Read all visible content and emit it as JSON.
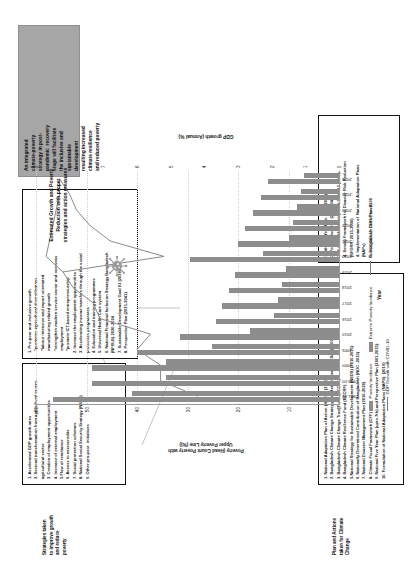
{
  "figure": {
    "annotation_caption": "Estimated  Growth and Poverty\nReduction with proper\nstrategies and action measures",
    "grey_callout": "An integrated\nclimate-poverty\nstrategy in post-\npandemic  recovery\nstage will facilitate\nthe inclusive and\nsustainable\ndevelopment\nresulting increased\nclimate resilience\nand reduced poverty",
    "left_label_growth": "Strategies taken\nto improve growth\nand reduce\npoverty",
    "left_label_climate": "Plan and Actions\ntaken for Climate\nChange",
    "virus_icon": "coronavirus-icon"
  },
  "chart_data": {
    "type": "bar",
    "title": "",
    "xlabel": "Year",
    "ylabel": "Poverty (Head Count Poverty with\nUpper Poverty Line (%))",
    "y2label": "GDP growth (Annual %)",
    "ylim": [
      0,
      60
    ],
    "yticks": [
      0,
      10,
      20,
      30,
      40,
      50,
      60
    ],
    "y2lim": [
      0,
      9
    ],
    "y2ticks": [
      0,
      1,
      2,
      3,
      4,
      5,
      6,
      7,
      8,
      9
    ],
    "grid": true,
    "legend_position": "bottom",
    "categories": [
      "1991-92",
      "1999-00",
      "2000",
      "2005",
      "2010",
      "2016",
      "2017",
      "2018",
      "2019",
      "2020",
      "2021",
      "2022",
      "2023",
      "2024",
      "2025"
    ],
    "series": [
      {
        "name": "Poverty Incidence",
        "type": "bar",
        "axis": "left",
        "color": "#8d8d8d",
        "values": [
          56.7,
          48.9,
          48.9,
          40.0,
          31.5,
          24.3,
          23.1,
          21.8,
          20.5,
          29.5,
          20.0,
          18.7,
          17.0,
          15.5,
          14.0
        ]
      },
      {
        "name": "Extreme Poverty Incidence",
        "type": "bar",
        "axis": "left",
        "color": "#8d8d8d",
        "values": [
          41.0,
          34.3,
          34.3,
          25.1,
          17.6,
          12.9,
          12.1,
          11.3,
          10.5,
          15.0,
          10.0,
          9.2,
          8.4,
          7.6,
          6.9
        ]
      },
      {
        "name": "Pre-COVID-19 GDP Growth",
        "type": "line",
        "axis": "right",
        "color": "#7d7d7d",
        "values": [
          4.2,
          5.3,
          5.3,
          6.0,
          5.6,
          7.1,
          7.3,
          7.9,
          8.2,
          8.7,
          8.6,
          8.5,
          8.4,
          8.3,
          8.3
        ]
      },
      {
        "name": "GDP Growth with COVID-19",
        "type": "line",
        "axis": "right",
        "color": "#7d7d7d",
        "values": [
          null,
          null,
          null,
          null,
          null,
          null,
          null,
          null,
          8.2,
          5.2,
          6.8,
          7.4,
          7.8,
          8.0,
          8.3
        ]
      }
    ],
    "legend": [
      "Poverty Incidence",
      "Extreme Poverty Incidence",
      "Pre-COVID-19 GDP Growth",
      "GDP Growth with COVID-19"
    ]
  },
  "box_growth_strategies": {
    "items": [
      "1. Accelerated GDP growth rates",
      "2. Sectoral transformation from agricultural to non-\nagricultural sector",
      "3. Creation of employment opportunities",
      "4. Increase of external employment",
      "5.Flow of remittance",
      "6. Access to microcredits",
      "7. Social protection schemes",
      "8. National Social Security Strategy (NSSS)",
      "9. Other pro-poor  initiatives"
    ]
  },
  "box_propoor_growth": {
    "items": [
      "1. Pro-poor and inclusive growth",
      "  *promotes agricultural diversification",
      "  *labour intensive and export orientated\n  manufacturing related growth",
      "  *strengthen modern service sector and overseas\n  employment",
      "  *promote ICT-based entrepreneurship",
      "2. Increase the employment opportunities",
      "3. Accelerating income transfers through the social\nprotection programmes",
      "4. Education and training programmes",
      "5. Universal Health Care system",
      "6. National Financial Inclusion Strategy Bangladesh\n(NFIS-B) 2020-2024",
      "7. Sustainable Development Goal 01 (2030)",
      "8. Perspective Plan (2021-2041)"
    ]
  },
  "box_climate_plans": {
    "items": [
      "1. National Adaptation Plan of Action (NAPA)  (2005)",
      "2. Bangladesh Climate Change Strategy and Action Plan (BCCSAP) (2009)",
      "3. Bangladesh Climate Change Trust Fund (BCCTF)",
      "4. Bangladesh Climate Resilience Fund (BCCRF)",
      "5.National Strategy for Sustainable Development (NSDS) (2010-2021)",
      "6. Nationally Determined Contribution of Bangladesh (NDC -2015)",
      "7. National Disaster Management Plan (2016-2020)",
      "8. Climate Fiscal Framework (CFF)",
      "9. National Five Year Plan (upto 7th) and Perspective Plan (2001-2021)",
      "10. Formulation of National Adaptation Plans (NAPS)  (2019)"
    ]
  },
  "box_future_plans": {
    "items": [
      "1. 8th Five Year Plan (2021-2025)",
      "2. Perspective Plan (2021-2041)",
      "3. Sustainable Development Goal -13 (2030)",
      "4. Sendai Framework for Disaster Risk Reduction\n(SFDRR, 2015-2030)",
      "4. Implementation of  National Adaptation Plans\n(NAPs)",
      "5. Bangladesh Delta Plan 2100"
    ]
  }
}
